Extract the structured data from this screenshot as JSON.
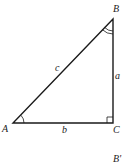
{
  "diagram": {
    "type": "right-triangle",
    "vertices": {
      "A": {
        "label": "A"
      },
      "B": {
        "label": "B"
      },
      "C": {
        "label": "C"
      }
    },
    "sides": {
      "a": {
        "label": "a",
        "between": [
          "B",
          "C"
        ]
      },
      "b": {
        "label": "b",
        "between": [
          "A",
          "C"
        ]
      },
      "c": {
        "label": "c",
        "between": [
          "A",
          "B"
        ]
      }
    },
    "angle_marks": {
      "A": "single-arc",
      "B": "double-arc",
      "C": "right-angle"
    },
    "extra_label": "B'",
    "colors": {
      "line": "#1a1a1a",
      "text": "#222222",
      "background": "#ffffff"
    }
  }
}
